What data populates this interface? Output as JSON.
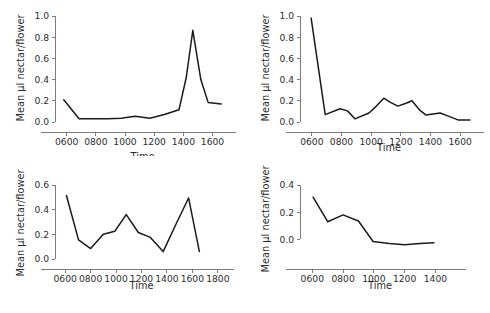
{
  "figure": {
    "panel_count": 4,
    "line_color": "#1a1a1a",
    "axis_color": "#6e6e6e",
    "background": "#ffffff"
  },
  "chart_data": [
    {
      "panel": "top-left",
      "type": "line",
      "title": "",
      "xlabel": "Time",
      "ylabel": "Mean µl nectar/flower",
      "xlim": [
        520,
        1720
      ],
      "ylim": [
        0.0,
        1.0
      ],
      "xticks": [
        600,
        800,
        1000,
        1200,
        1400,
        1600
      ],
      "xticklabels": [
        "0600",
        "0800",
        "1000",
        "1200",
        "1400",
        "1600"
      ],
      "yticks": [
        0.0,
        0.2,
        0.4,
        0.6,
        0.8,
        1.0
      ],
      "yticklabels": [
        "0.0",
        "0.2",
        "0.4",
        "0.6",
        "0.8",
        "1.0"
      ],
      "grid": false,
      "legend": null,
      "x": [
        580,
        685,
        780,
        880,
        975,
        1070,
        1170,
        1270,
        1370,
        1420,
        1465,
        1520,
        1570,
        1660
      ],
      "y": [
        0.21,
        0.03,
        0.03,
        0.03,
        0.035,
        0.055,
        0.035,
        0.07,
        0.115,
        0.42,
        0.865,
        0.4,
        0.185,
        0.17
      ]
    },
    {
      "panel": "top-right",
      "type": "line",
      "title": "",
      "xlabel": "Time",
      "ylabel": "Mean µl nectar/flower",
      "xlim": [
        520,
        1720
      ],
      "ylim": [
        0.0,
        1.0
      ],
      "xticks": [
        600,
        800,
        1000,
        1200,
        1400,
        1600
      ],
      "xticklabels": [
        "0600",
        "0800",
        "1000",
        "1200",
        "1400",
        "1600"
      ],
      "yticks": [
        0.0,
        0.2,
        0.4,
        0.6,
        0.8,
        1.0
      ],
      "yticklabels": [
        "0.0",
        "0.2",
        "0.4",
        "0.6",
        "0.8",
        "1.0"
      ],
      "grid": false,
      "legend": null,
      "x": [
        595,
        690,
        790,
        840,
        890,
        985,
        1035,
        1085,
        1130,
        1180,
        1230,
        1275,
        1325,
        1370,
        1465,
        1520,
        1585,
        1665
      ],
      "y": [
        0.98,
        0.07,
        0.125,
        0.105,
        0.03,
        0.085,
        0.15,
        0.225,
        0.185,
        0.15,
        0.175,
        0.2,
        0.115,
        0.065,
        0.085,
        0.055,
        0.02,
        0.02
      ]
    },
    {
      "panel": "bottom-left",
      "type": "line",
      "title": "",
      "xlabel": "Time",
      "ylabel": "Mean µl nectar/flower",
      "xlim": [
        520,
        1880
      ],
      "ylim": [
        0.0,
        0.6
      ],
      "xticks": [
        600,
        800,
        1000,
        1200,
        1400,
        1600,
        1800
      ],
      "xticklabels": [
        "0600",
        "0800",
        "1000",
        "1200",
        "1400",
        "1600",
        "1800"
      ],
      "yticks": [
        0.0,
        0.2,
        0.4,
        0.6
      ],
      "yticklabels": [
        "0.0",
        "0.2",
        "0.4",
        "0.6"
      ],
      "grid": false,
      "legend": null,
      "x": [
        610,
        705,
        800,
        900,
        990,
        1080,
        1175,
        1270,
        1370,
        1470,
        1570,
        1655
      ],
      "y": [
        0.515,
        0.155,
        0.085,
        0.2,
        0.225,
        0.36,
        0.215,
        0.175,
        0.06,
        0.28,
        0.495,
        0.06
      ]
    },
    {
      "panel": "bottom-right",
      "type": "line",
      "title": "",
      "xlabel": "Time",
      "ylabel": "Mean µl nectar/flower",
      "xlim": [
        520,
        1560
      ],
      "ylim": [
        -0.1,
        0.4
      ],
      "xticks": [
        600,
        800,
        1000,
        1200,
        1400
      ],
      "xticklabels": [
        "0600",
        "0800",
        "1000",
        "1200",
        "1400"
      ],
      "yticks": [
        0.0,
        0.2,
        0.4
      ],
      "yticklabels": [
        "0.0",
        "0.2",
        "0.4"
      ],
      "grid": false,
      "legend": null,
      "x": [
        605,
        700,
        800,
        900,
        995,
        1100,
        1200,
        1300,
        1390
      ],
      "y": [
        0.31,
        0.13,
        0.18,
        0.135,
        -0.015,
        -0.03,
        -0.04,
        -0.03,
        -0.025
      ]
    }
  ]
}
